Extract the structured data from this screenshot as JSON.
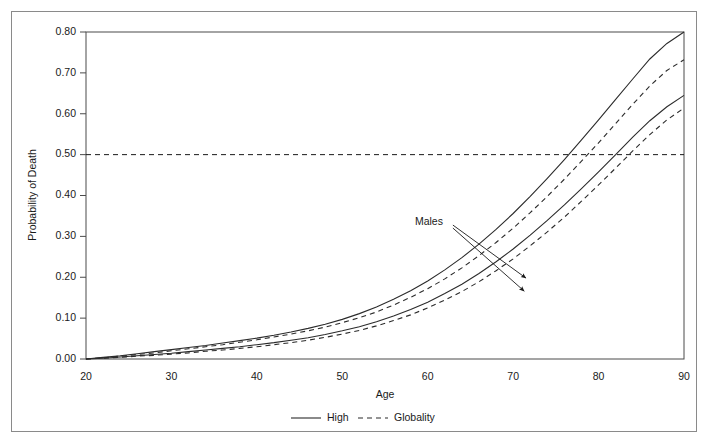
{
  "chart_data": {
    "type": "line",
    "title": "",
    "xlabel": "Age",
    "ylabel": "Probability of Death",
    "xlim": [
      20,
      90
    ],
    "ylim": [
      0.0,
      0.8
    ],
    "xticks": [
      "20",
      "30",
      "40",
      "50",
      "60",
      "70",
      "80",
      "90"
    ],
    "xtick_values": [
      20,
      30,
      40,
      50,
      60,
      70,
      80,
      90
    ],
    "yticks": [
      "0.00",
      "0.10",
      "0.20",
      "0.30",
      "0.40",
      "0.50",
      "0.60",
      "0.70",
      "0.80"
    ],
    "ytick_values": [
      0.0,
      0.1,
      0.2,
      0.3,
      0.4,
      0.5,
      0.6,
      0.7,
      0.8
    ],
    "grid": false,
    "legend_position": "bottom",
    "reference_lines": [
      {
        "name": "half-probability-line",
        "orientation": "horizontal",
        "value": 0.5,
        "style": "dashed"
      }
    ],
    "annotations": [
      {
        "name": "males-annotation",
        "text": "Males",
        "x": 58.5,
        "y": 0.335,
        "arrows": [
          {
            "to_x": 71.5,
            "to_y": 0.198
          },
          {
            "to_x": 71.3,
            "to_y": 0.166
          }
        ]
      }
    ],
    "x": [
      20,
      22,
      24,
      26,
      28,
      30,
      32,
      34,
      36,
      38,
      40,
      42,
      44,
      46,
      48,
      50,
      52,
      54,
      56,
      58,
      60,
      62,
      64,
      66,
      68,
      70,
      72,
      74,
      76,
      78,
      80,
      82,
      84,
      86,
      88,
      90
    ],
    "series": [
      {
        "name": "Males High",
        "group": "Males",
        "scenario": "High",
        "style": "solid",
        "color": "#2b2b2b",
        "values": [
          0.0,
          0.004,
          0.008,
          0.013,
          0.018,
          0.023,
          0.028,
          0.033,
          0.039,
          0.045,
          0.051,
          0.058,
          0.066,
          0.075,
          0.085,
          0.097,
          0.111,
          0.127,
          0.146,
          0.167,
          0.191,
          0.218,
          0.248,
          0.281,
          0.317,
          0.356,
          0.398,
          0.442,
          0.488,
          0.536,
          0.585,
          0.635,
          0.685,
          0.734,
          0.772,
          0.8
        ]
      },
      {
        "name": "Males Globality",
        "group": "Males",
        "scenario": "Globality",
        "style": "dashed",
        "color": "#2b2b2b",
        "values": [
          0.0,
          0.003,
          0.007,
          0.011,
          0.015,
          0.02,
          0.025,
          0.03,
          0.035,
          0.041,
          0.047,
          0.054,
          0.061,
          0.069,
          0.078,
          0.089,
          0.101,
          0.115,
          0.132,
          0.151,
          0.172,
          0.196,
          0.223,
          0.253,
          0.285,
          0.32,
          0.358,
          0.398,
          0.44,
          0.484,
          0.529,
          0.576,
          0.623,
          0.668,
          0.706,
          0.732
        ]
      },
      {
        "name": "Females High",
        "group": "Females",
        "scenario": "High",
        "style": "solid",
        "color": "#2b2b2b",
        "values": [
          0.0,
          0.002,
          0.005,
          0.008,
          0.011,
          0.014,
          0.018,
          0.022,
          0.026,
          0.03,
          0.035,
          0.04,
          0.046,
          0.052,
          0.06,
          0.069,
          0.079,
          0.091,
          0.105,
          0.121,
          0.139,
          0.16,
          0.183,
          0.209,
          0.238,
          0.269,
          0.303,
          0.339,
          0.377,
          0.417,
          0.458,
          0.5,
          0.543,
          0.583,
          0.617,
          0.645
        ]
      },
      {
        "name": "Females Globality",
        "group": "Females",
        "scenario": "Globality",
        "style": "dashed",
        "color": "#2b2b2b",
        "values": [
          0.0,
          0.002,
          0.004,
          0.007,
          0.009,
          0.012,
          0.015,
          0.019,
          0.022,
          0.026,
          0.03,
          0.035,
          0.04,
          0.046,
          0.053,
          0.061,
          0.07,
          0.081,
          0.094,
          0.108,
          0.125,
          0.144,
          0.165,
          0.189,
          0.216,
          0.245,
          0.277,
          0.311,
          0.347,
          0.386,
          0.426,
          0.467,
          0.509,
          0.549,
          0.585,
          0.614
        ]
      }
    ],
    "legend": [
      {
        "name": "legend-high",
        "label": "High",
        "style": "solid"
      },
      {
        "name": "legend-globality",
        "label": "Globality",
        "style": "dashed"
      }
    ]
  }
}
